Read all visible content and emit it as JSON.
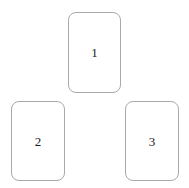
{
  "canvas": {
    "width": 189,
    "height": 188,
    "background_color": "#ffffff"
  },
  "style": {
    "card_fill": "#ffffff",
    "card_border_color": "#a9a9a9",
    "card_border_width": 1,
    "card_corner_radius": 8,
    "label_color": "#1a1a1a"
  },
  "cards": [
    {
      "label": "1",
      "position": "top-center",
      "x": 68,
      "y": 12,
      "width": 53,
      "height": 81
    },
    {
      "label": "2",
      "position": "bottom-left",
      "x": 11,
      "y": 101,
      "width": 54,
      "height": 80
    },
    {
      "label": "3",
      "position": "bottom-right",
      "x": 125,
      "y": 101,
      "width": 54,
      "height": 80
    }
  ]
}
